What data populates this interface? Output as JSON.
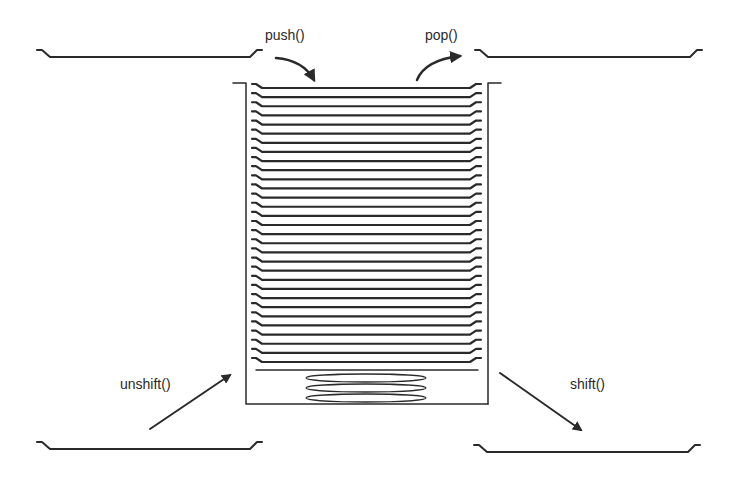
{
  "diagram": {
    "plate_count": 31,
    "bottom_stack_count": 3,
    "operations": {
      "push": {
        "label": "push()",
        "direction": "into top"
      },
      "pop": {
        "label": "pop()",
        "direction": "out of top"
      },
      "unshift": {
        "label": "unshift()",
        "direction": "into bottom"
      },
      "shift": {
        "label": "shift()",
        "direction": "out of bottom"
      }
    },
    "colors": {
      "stroke": "#2a2a2a",
      "background": "#ffffff"
    }
  }
}
